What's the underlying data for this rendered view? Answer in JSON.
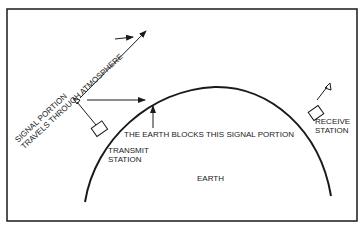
{
  "diagram": {
    "labels": {
      "signal_line1": "SIGNAL PORTION",
      "signal_line2": "TRAVELS THROUGH ATMOSPHERE",
      "blocked": "THE EARTH BLOCKS THIS SIGNAL PORTION",
      "transmit_line1": "TRANSMIT",
      "transmit_line2": "STATION",
      "receive_line1": "RECEIVE",
      "receive_line2": "STATION",
      "earth": "EARTH"
    },
    "colors": {
      "line": "#1a1a1a",
      "background": "#ffffff"
    }
  }
}
